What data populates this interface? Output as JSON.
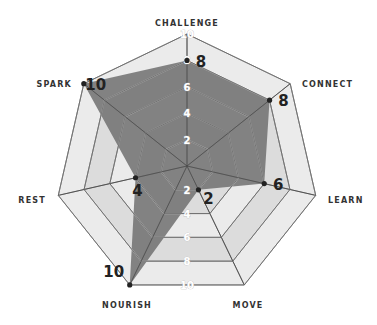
{
  "chart_data": {
    "type": "radar",
    "title": "",
    "categories": [
      "CHALLENGE",
      "CONNECT",
      "LEARN",
      "MOVE",
      "NOURISH",
      "REST",
      "SPARK"
    ],
    "values": [
      8,
      8,
      6,
      2,
      10,
      4,
      10
    ],
    "value_labels": [
      "8",
      "8",
      "6",
      "2",
      "10",
      "4",
      "10"
    ],
    "rlim": [
      0,
      10
    ],
    "ticks": [
      2,
      4,
      6,
      8,
      10
    ],
    "tick_labels": [
      "2",
      "4",
      "6",
      "8",
      "10"
    ],
    "grid": true,
    "legend": "none",
    "colors": {
      "fill": "#707070",
      "ring_light": "#ebebeb",
      "ring_mid": "#dcdcdc",
      "grid_line": "#444444",
      "point": "#222222"
    }
  }
}
